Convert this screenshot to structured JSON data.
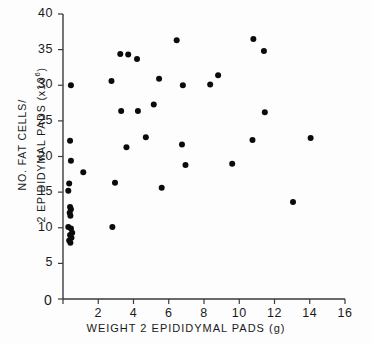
{
  "chart_data": {
    "type": "scatter",
    "title": "",
    "xlabel": "WEIGHT 2 EPIDIDYMAL PADS (g)",
    "ylabel_line1": "NO. FAT CELLS/",
    "ylabel_line2": "2 EPIDIDYMAL PADS (x10",
    "ylabel_exponent": "6",
    "ylabel_line2_tail": ")",
    "xlim": [
      0,
      16
    ],
    "ylim": [
      0,
      40
    ],
    "xticks": [
      0,
      2,
      4,
      6,
      8,
      10,
      12,
      14,
      16
    ],
    "xtick_labels": [
      "0",
      "2",
      "4",
      "6",
      "8",
      "10",
      "12",
      "14",
      "16"
    ],
    "yticks": [
      0,
      5,
      10,
      15,
      20,
      25,
      30,
      35,
      40
    ],
    "ytick_labels": [
      "0",
      "5",
      "10",
      "15",
      "20",
      "25",
      "30",
      "35",
      "40"
    ],
    "grid": false,
    "legend": "none",
    "marker": "filled-circle",
    "marker_color": "#0b0b0b",
    "marker_radius_px": 3.0,
    "series": [
      {
        "name": "rats",
        "points": [
          [
            0.45,
            30.0
          ],
          [
            0.4,
            22.2
          ],
          [
            0.45,
            19.4
          ],
          [
            0.35,
            16.2
          ],
          [
            0.3,
            15.2
          ],
          [
            0.4,
            12.9
          ],
          [
            0.45,
            12.6
          ],
          [
            0.38,
            12.1
          ],
          [
            0.42,
            11.7
          ],
          [
            0.3,
            10.1
          ],
          [
            0.45,
            9.9
          ],
          [
            0.52,
            9.3
          ],
          [
            0.4,
            9.0
          ],
          [
            0.48,
            8.6
          ],
          [
            0.35,
            8.2
          ],
          [
            0.42,
            7.9
          ],
          [
            1.15,
            17.8
          ],
          [
            2.8,
            10.1
          ],
          [
            2.75,
            30.6
          ],
          [
            2.95,
            16.3
          ],
          [
            3.25,
            34.4
          ],
          [
            3.3,
            26.4
          ],
          [
            3.7,
            34.3
          ],
          [
            3.6,
            21.3
          ],
          [
            4.2,
            33.7
          ],
          [
            4.25,
            26.4
          ],
          [
            4.7,
            22.7
          ],
          [
            5.15,
            27.3
          ],
          [
            5.45,
            30.9
          ],
          [
            5.6,
            15.6
          ],
          [
            6.45,
            36.3
          ],
          [
            6.8,
            30.0
          ],
          [
            6.75,
            21.7
          ],
          [
            6.95,
            18.8
          ],
          [
            8.35,
            30.1
          ],
          [
            8.8,
            31.4
          ],
          [
            9.6,
            19.0
          ],
          [
            10.8,
            36.5
          ],
          [
            10.75,
            22.3
          ],
          [
            11.4,
            34.8
          ],
          [
            11.45,
            26.2
          ],
          [
            13.05,
            13.6
          ],
          [
            14.05,
            22.6
          ]
        ]
      }
    ]
  },
  "axes_geometry": {
    "x0_px": 63,
    "x1_px": 345,
    "y0_px": 299,
    "y1_px": 14
  }
}
